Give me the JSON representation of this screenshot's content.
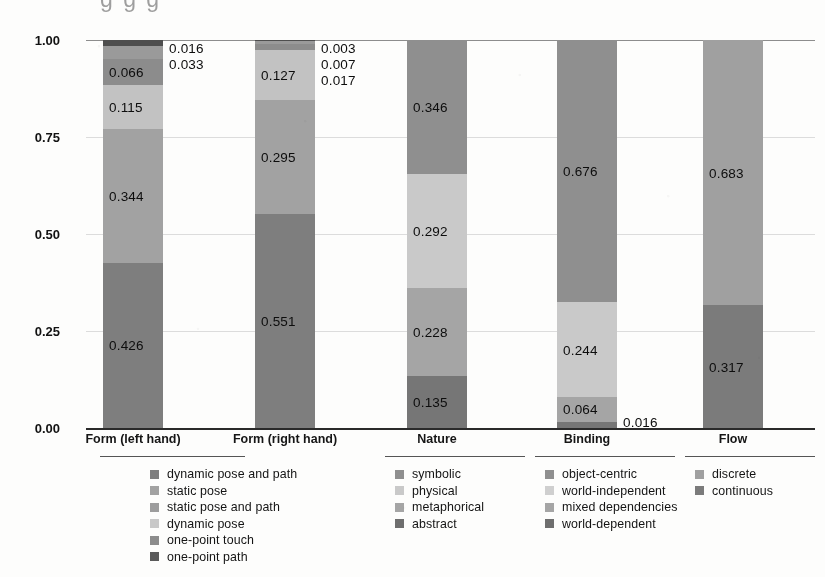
{
  "ghost_header": "    g   g                                                          g",
  "chart_data": {
    "type": "bar",
    "subtype": "stacked-bar-100",
    "title": "",
    "xlabel": "",
    "ylabel": "",
    "ylim": [
      0,
      1
    ],
    "yticks": [
      "0.00",
      "0.25",
      "0.50",
      "0.75",
      "1.00"
    ],
    "ytick_values": [
      0,
      0.25,
      0.5,
      0.75,
      1.0
    ],
    "grid": true,
    "legend_position": "bottom",
    "categories": [
      "Form (left hand)",
      "Form (right hand)",
      "Nature",
      "Binding",
      "Flow"
    ],
    "groups": [
      {
        "category": "Form (left hand)",
        "segments": [
          {
            "name": "one-point path",
            "value": 0.016,
            "label": "0.016",
            "color": "#4e4e4e",
            "label_pos": "outside"
          },
          {
            "name": "one-point touch",
            "value": 0.033,
            "label": "0.033",
            "color": "#9a9a9a",
            "label_pos": "outside"
          },
          {
            "name": "dynamic pose",
            "value": 0.066,
            "label": "0.066",
            "color": "#8c8c8c",
            "label_pos": "inside"
          },
          {
            "name": "static pose and path",
            "value": 0.115,
            "label": "0.115",
            "color": "#c2c2c2",
            "label_pos": "inside"
          },
          {
            "name": "static pose",
            "value": 0.344,
            "label": "0.344",
            "color": "#a2a2a2",
            "label_pos": "inside"
          },
          {
            "name": "dynamic pose and path",
            "value": 0.426,
            "label": "0.426",
            "color": "#7e7e7e",
            "label_pos": "inside"
          }
        ]
      },
      {
        "category": "Form (right hand)",
        "segments": [
          {
            "name": "one-point path",
            "value": 0.003,
            "label": "0.003",
            "color": "#4e4e4e",
            "label_pos": "outside"
          },
          {
            "name": "one-point touch",
            "value": 0.007,
            "label": "0.007",
            "color": "#9a9a9a",
            "label_pos": "outside"
          },
          {
            "name": "dynamic pose",
            "value": 0.017,
            "label": "0.017",
            "color": "#8c8c8c",
            "label_pos": "outside"
          },
          {
            "name": "static pose and path",
            "value": 0.127,
            "label": "0.127",
            "color": "#c2c2c2",
            "label_pos": "inside"
          },
          {
            "name": "static pose",
            "value": 0.295,
            "label": "0.295",
            "color": "#a2a2a2",
            "label_pos": "inside"
          },
          {
            "name": "dynamic pose and path",
            "value": 0.551,
            "label": "0.551",
            "color": "#7e7e7e",
            "label_pos": "inside"
          }
        ]
      },
      {
        "category": "Nature",
        "segments": [
          {
            "name": "symbolic",
            "value": 0.346,
            "label": "0.346",
            "color": "#8f8f8f",
            "label_pos": "inside"
          },
          {
            "name": "physical",
            "value": 0.292,
            "label": "0.292",
            "color": "#c9c9c9",
            "label_pos": "inside"
          },
          {
            "name": "metaphorical",
            "value": 0.228,
            "label": "0.228",
            "color": "#a5a5a5",
            "label_pos": "inside"
          },
          {
            "name": "abstract",
            "value": 0.135,
            "label": "0.135",
            "color": "#767676",
            "label_pos": "inside"
          }
        ]
      },
      {
        "category": "Binding",
        "segments": [
          {
            "name": "object-centric",
            "value": 0.676,
            "label": "0.676",
            "color": "#8f8f8f",
            "label_pos": "inside"
          },
          {
            "name": "world-independent",
            "value": 0.244,
            "label": "0.244",
            "color": "#c9c9c9",
            "label_pos": "inside"
          },
          {
            "name": "mixed dependencies",
            "value": 0.064,
            "label": "0.064",
            "color": "#a5a5a5",
            "label_pos": "inside"
          },
          {
            "name": "world-dependent",
            "value": 0.016,
            "label": "0.016",
            "color": "#767676",
            "label_pos": "outside"
          }
        ]
      },
      {
        "category": "Flow",
        "segments": [
          {
            "name": "discrete",
            "value": 0.683,
            "label": "0.683",
            "color": "#a0a0a0",
            "label_pos": "inside"
          },
          {
            "name": "continuous",
            "value": 0.317,
            "label": "0.317",
            "color": "#7b7b7b",
            "label_pos": "inside"
          }
        ]
      }
    ],
    "legend_columns": [
      {
        "items": [
          {
            "label": "dynamic pose and path",
            "color": "#7e7e7e"
          },
          {
            "label": "static pose",
            "color": "#a2a2a2"
          },
          {
            "label": "static pose and path",
            "color": "#9d9d9d"
          },
          {
            "label": "dynamic pose",
            "color": "#c8c8c8"
          },
          {
            "label": "one-point touch",
            "color": "#8c8c8c"
          },
          {
            "label": "one-point path",
            "color": "#5a5a5a"
          }
        ]
      },
      {
        "items": [
          {
            "label": "symbolic",
            "color": "#8f8f8f"
          },
          {
            "label": "physical",
            "color": "#c9c9c9"
          },
          {
            "label": "metaphorical",
            "color": "#a5a5a5"
          },
          {
            "label": "abstract",
            "color": "#6e6e6e"
          }
        ]
      },
      {
        "items": [
          {
            "label": "object-centric",
            "color": "#8f8f8f"
          },
          {
            "label": "world-independent",
            "color": "#cfcfcf"
          },
          {
            "label": "mixed dependencies",
            "color": "#a5a5a5"
          },
          {
            "label": "world-dependent",
            "color": "#6e6e6e"
          }
        ]
      },
      {
        "items": [
          {
            "label": "discrete",
            "color": "#a0a0a0"
          },
          {
            "label": "continuous",
            "color": "#7b7b7b"
          }
        ]
      }
    ]
  }
}
